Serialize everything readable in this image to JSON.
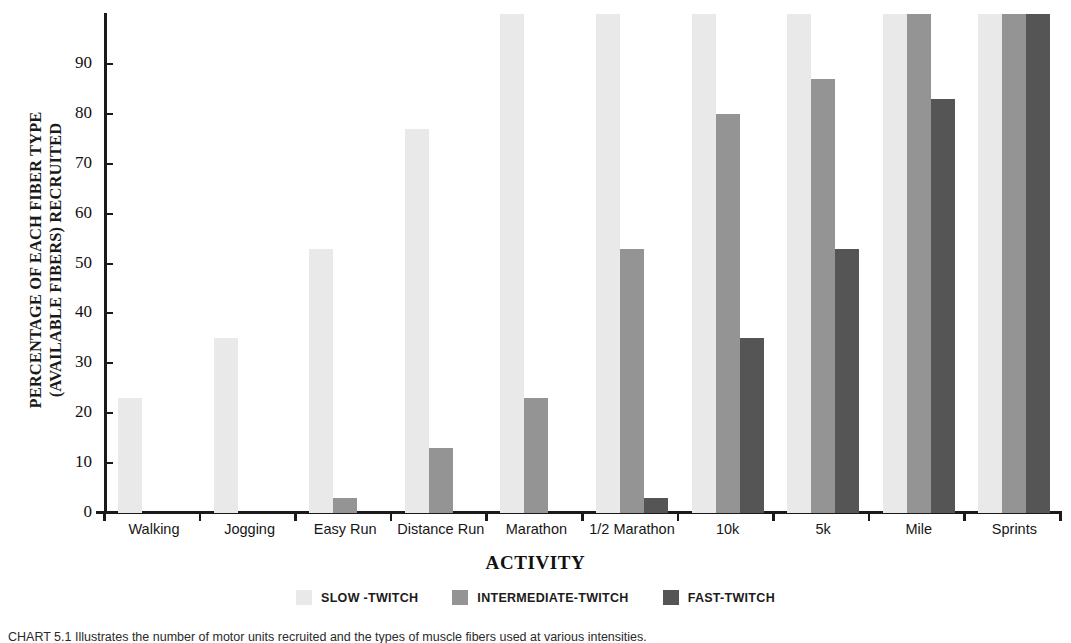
{
  "chart_data": {
    "type": "bar",
    "title": "",
    "subtitle": "",
    "xlabel": "ACTIVITY",
    "ylabel": "PERCENTAGE OF EACH FIBER TYPE\n(AVAILABLE FIBERS) RECRUITED",
    "ylim": [
      0,
      100
    ],
    "ytick_values": [
      0,
      10,
      20,
      30,
      40,
      50,
      60,
      70,
      80,
      90
    ],
    "ytick_labels": [
      "0",
      "10",
      "20",
      "30",
      "40",
      "50",
      "60",
      "70",
      "80",
      "90"
    ],
    "grid": false,
    "legend_position": "bottom",
    "categories": [
      "Walking",
      "Jogging",
      "Easy Run",
      "Distance Run",
      "Marathon",
      "1/2 Marathon",
      "10k",
      "5k",
      "Mile",
      "Sprints"
    ],
    "series": [
      {
        "name": "SLOW -TWITCH",
        "color": "#e9e9e9",
        "values": [
          23,
          35,
          53,
          77,
          100,
          100,
          100,
          100,
          100,
          100
        ]
      },
      {
        "name": "INTERMEDIATE-TWITCH",
        "color": "#949494",
        "values": [
          0,
          0,
          3,
          13,
          23,
          53,
          80,
          87,
          100,
          100
        ]
      },
      {
        "name": "FAST-TWITCH",
        "color": "#555555",
        "values": [
          0,
          0,
          0,
          0,
          0,
          3,
          35,
          53,
          83,
          100
        ]
      }
    ]
  },
  "legend": {
    "items": [
      {
        "label": "SLOW -TWITCH",
        "swatch": "slow-twitch-swatch"
      },
      {
        "label": "INTERMEDIATE-TWITCH",
        "swatch": "intermediate-twitch-swatch"
      },
      {
        "label": "FAST-TWITCH",
        "swatch": "fast-twitch-swatch"
      }
    ]
  },
  "caption": {
    "text": "CHART 5.1  Illustrates the number of motor units recruited and the types of muscle fibers used at various intensities."
  }
}
